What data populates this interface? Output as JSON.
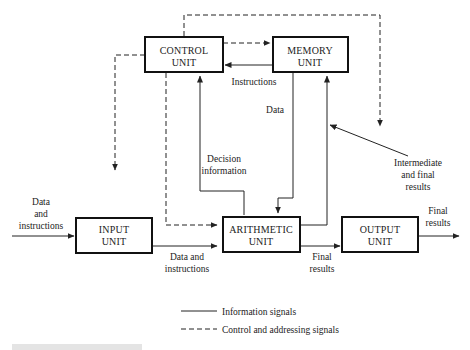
{
  "diagram": {
    "units": [
      {
        "id": "control",
        "line1": "CONTROL",
        "line2": "UNIT"
      },
      {
        "id": "memory",
        "line1": "MEMORY",
        "line2": "UNIT"
      },
      {
        "id": "input",
        "line1": "INPUT",
        "line2": "UNIT"
      },
      {
        "id": "arithmetic",
        "line1": "ARITHMETIC",
        "line2": "UNIT"
      },
      {
        "id": "output",
        "line1": "OUTPUT",
        "line2": "UNIT"
      }
    ],
    "labels": {
      "instructions": "Instructions",
      "data": "Data",
      "decision_1": "Decision",
      "decision_2": "information",
      "intermediate_1": "Intermediate",
      "intermediate_2": "and final",
      "intermediate_3": "results",
      "data_in_1": "Data",
      "data_in_2": "and",
      "data_in_3": "instructions",
      "data_instr_1": "Data and",
      "data_instr_2": "instructions",
      "final_mid_1": "Final",
      "final_mid_2": "results",
      "final_out_1": "Final",
      "final_out_2": "results"
    },
    "legend": {
      "solid": "Information signals",
      "dashed": "Control and addressing signals"
    }
  }
}
